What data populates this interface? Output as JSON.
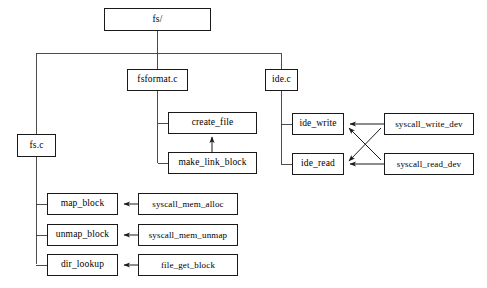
{
  "diagram": {
    "type": "block-diagram",
    "style": {
      "background": "#ffffff",
      "box_border": "#1a1a1a",
      "line_color": "#3a3a3a",
      "text_color": "#000000"
    },
    "nodes": [
      {
        "id": "fs_dir",
        "label": "fs/",
        "x": 104,
        "y": 8,
        "w": 107,
        "h": 23
      },
      {
        "id": "fsformat_c",
        "label": "fsformat.c",
        "x": 127,
        "y": 69,
        "w": 61,
        "h": 22
      },
      {
        "id": "ide_c",
        "label": "ide.c",
        "x": 265,
        "y": 69,
        "w": 33,
        "h": 22
      },
      {
        "id": "fs_c",
        "label": "fs.c",
        "x": 17,
        "y": 134,
        "w": 39,
        "h": 23
      },
      {
        "id": "create_file",
        "label": "create_file",
        "x": 168,
        "y": 112,
        "w": 89,
        "h": 22
      },
      {
        "id": "make_link_block",
        "label": "make_link_block",
        "x": 168,
        "y": 152,
        "w": 89,
        "h": 22
      },
      {
        "id": "ide_write",
        "label": "ide_write",
        "x": 292,
        "y": 113,
        "w": 52,
        "h": 22
      },
      {
        "id": "ide_read",
        "label": "ide_read",
        "x": 292,
        "y": 153,
        "w": 52,
        "h": 22
      },
      {
        "id": "syscall_write_dev",
        "label": "syscall_write_dev",
        "x": 384,
        "y": 113,
        "w": 90,
        "h": 22
      },
      {
        "id": "syscall_read_dev",
        "label": "syscall_read_dev",
        "x": 384,
        "y": 153,
        "w": 90,
        "h": 22
      },
      {
        "id": "map_block",
        "label": "map_block",
        "x": 47,
        "y": 193,
        "w": 71,
        "h": 22
      },
      {
        "id": "unmap_block",
        "label": "unmap_block",
        "x": 47,
        "y": 224,
        "w": 71,
        "h": 22
      },
      {
        "id": "dir_lookup",
        "label": "dir_lookup",
        "x": 47,
        "y": 254,
        "w": 71,
        "h": 22
      },
      {
        "id": "syscall_mem_alloc",
        "label": "syscall_mem_alloc",
        "x": 138,
        "y": 193,
        "w": 100,
        "h": 22
      },
      {
        "id": "syscall_mem_unmap",
        "label": "syscall_mem_unmap",
        "x": 138,
        "y": 224,
        "w": 100,
        "h": 22
      },
      {
        "id": "file_get_block",
        "label": "file_get_block",
        "x": 138,
        "y": 254,
        "w": 100,
        "h": 22
      }
    ],
    "edges": [
      {
        "from": "fs_dir",
        "to": "fsformat.c bus",
        "kind": "tree"
      },
      {
        "from": "fs_dir",
        "to": "fs.c",
        "kind": "tree"
      },
      {
        "from": "fs_dir",
        "to": "ide.c",
        "kind": "tree"
      },
      {
        "from": "fsformat.c",
        "to": "create_file",
        "kind": "tree"
      },
      {
        "from": "fsformat.c",
        "to": "make_link_block",
        "kind": "tree"
      },
      {
        "from": "make_link_block",
        "to": "create_file",
        "kind": "arrow-up"
      },
      {
        "from": "ide.c",
        "to": "ide_write",
        "kind": "tree"
      },
      {
        "from": "ide.c",
        "to": "ide_read",
        "kind": "tree"
      },
      {
        "from": "syscall_write_dev",
        "to": "ide_write",
        "kind": "arrow"
      },
      {
        "from": "syscall_write_dev",
        "to": "ide_read",
        "kind": "arrow"
      },
      {
        "from": "syscall_read_dev",
        "to": "ide_write",
        "kind": "arrow"
      },
      {
        "from": "syscall_read_dev",
        "to": "ide_read",
        "kind": "arrow"
      },
      {
        "from": "fs.c",
        "to": "map_block",
        "kind": "tree"
      },
      {
        "from": "fs.c",
        "to": "unmap_block",
        "kind": "tree"
      },
      {
        "from": "fs.c",
        "to": "dir_lookup",
        "kind": "tree"
      },
      {
        "from": "syscall_mem_alloc",
        "to": "map_block",
        "kind": "arrow"
      },
      {
        "from": "syscall_mem_unmap",
        "to": "unmap_block",
        "kind": "arrow"
      },
      {
        "from": "file_get_block",
        "to": "dir_lookup",
        "kind": "arrow"
      }
    ]
  }
}
